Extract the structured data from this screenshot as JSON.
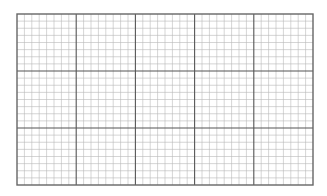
{
  "grid": {
    "left": 17,
    "top": 14,
    "width": 296,
    "height": 171,
    "major_cols": 5,
    "major_rows": 3,
    "minor_per_major_x": 8,
    "minor_per_major_y": 8,
    "colors": {
      "minor": "#b8b8b8",
      "major": "#555555",
      "border": "#666666"
    }
  }
}
